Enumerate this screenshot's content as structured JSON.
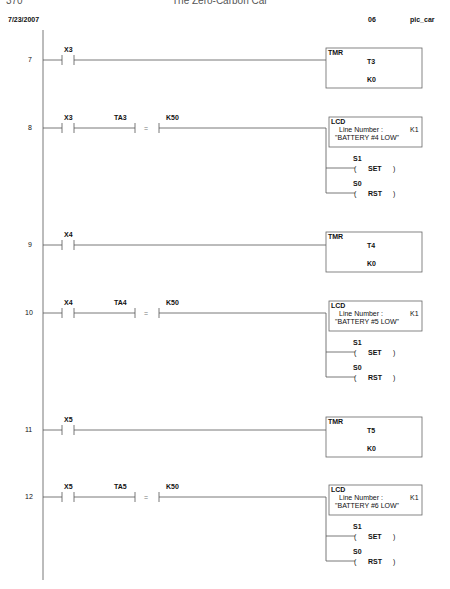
{
  "page_header": {
    "page_number": "370",
    "book_title": "The Zero-Carbon Car"
  },
  "printout_header": {
    "date": "7/23/2007",
    "page": "06",
    "project": "pic_car"
  },
  "rungs": [
    {
      "number": "7",
      "contact": "X3",
      "instruction": {
        "type": "TMR",
        "timer": "T3",
        "preset": "K0"
      }
    },
    {
      "number": "8",
      "contact": "X3",
      "compare": {
        "left": "TA3",
        "op": "=",
        "right": "K50"
      },
      "lcd": {
        "title": "LCD",
        "line_label": "Line Number :",
        "line_value": "K1",
        "message": "\"BATTERY #4 LOW\""
      },
      "coils": [
        {
          "addr": "S1",
          "action": "SET"
        },
        {
          "addr": "S0",
          "action": "RST"
        }
      ]
    },
    {
      "number": "9",
      "contact": "X4",
      "instruction": {
        "type": "TMR",
        "timer": "T4",
        "preset": "K0"
      }
    },
    {
      "number": "10",
      "contact": "X4",
      "compare": {
        "left": "TA4",
        "op": "=",
        "right": "K50"
      },
      "lcd": {
        "title": "LCD",
        "line_label": "Line Number :",
        "line_value": "K1",
        "message": "\"BATTERY #5 LOW\""
      },
      "coils": [
        {
          "addr": "S1",
          "action": "SET"
        },
        {
          "addr": "S0",
          "action": "RST"
        }
      ]
    },
    {
      "number": "11",
      "contact": "X5",
      "instruction": {
        "type": "TMR",
        "timer": "T5",
        "preset": "K0"
      }
    },
    {
      "number": "12",
      "contact": "X5",
      "compare": {
        "left": "TA5",
        "op": "=",
        "right": "K50"
      },
      "lcd": {
        "title": "LCD",
        "line_label": "Line Number :",
        "line_value": "K1",
        "message": "\"BATTERY #6 LOW\""
      },
      "coils": [
        {
          "addr": "S1",
          "action": "SET"
        },
        {
          "addr": "S0",
          "action": "RST"
        }
      ]
    }
  ]
}
